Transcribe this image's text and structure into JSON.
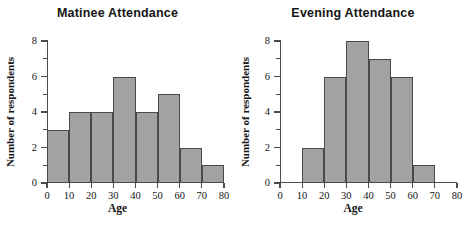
{
  "figure": {
    "panels": [
      "matinee",
      "evening"
    ]
  },
  "chart_data": [
    {
      "type": "bar",
      "title": "Matinee Attendance",
      "xlabel": "Age",
      "ylabel": "Number of respondents",
      "categories": [
        "0-10",
        "10-20",
        "20-30",
        "30-40",
        "40-50",
        "50-60",
        "60-70",
        "70-80"
      ],
      "bin_edges": [
        0,
        10,
        20,
        30,
        40,
        50,
        60,
        70,
        80
      ],
      "values": [
        3,
        4,
        4,
        6,
        4,
        5,
        2,
        1
      ],
      "xlim": [
        0,
        80
      ],
      "ylim": [
        0,
        8
      ],
      "xticks": [
        0,
        10,
        20,
        30,
        40,
        50,
        60,
        70,
        80
      ],
      "xticklabels": [
        "0",
        "10",
        "20",
        "30",
        "40",
        "50",
        "60",
        "70",
        "80"
      ],
      "yticks": [
        0,
        1,
        2,
        3,
        4,
        5,
        6,
        7,
        8
      ],
      "yticklabels": [
        "0",
        "",
        "2",
        "",
        "4",
        "",
        "6",
        "",
        "8"
      ],
      "grid": false,
      "legend": false,
      "bar_fill": "#a2a2a2",
      "bar_edge": "#4a4a4a"
    },
    {
      "type": "bar",
      "title": "Evening Attendance",
      "xlabel": "Age",
      "ylabel": "Number of respondents",
      "categories": [
        "0-10",
        "10-20",
        "20-30",
        "30-40",
        "40-50",
        "50-60",
        "60-70",
        "70-80"
      ],
      "bin_edges": [
        0,
        10,
        20,
        30,
        40,
        50,
        60,
        70,
        80
      ],
      "values": [
        0,
        2,
        6,
        8,
        7,
        6,
        1,
        0
      ],
      "xlim": [
        0,
        80
      ],
      "ylim": [
        0,
        8
      ],
      "xticks": [
        0,
        10,
        20,
        30,
        40,
        50,
        60,
        70,
        80
      ],
      "xticklabels": [
        "0",
        "10",
        "20",
        "30",
        "40",
        "50",
        "60",
        "70",
        "80"
      ],
      "yticks": [
        0,
        1,
        2,
        3,
        4,
        5,
        6,
        7,
        8
      ],
      "yticklabels": [
        "0",
        "",
        "2",
        "",
        "4",
        "",
        "6",
        "",
        "8"
      ],
      "grid": false,
      "legend": false,
      "bar_fill": "#a2a2a2",
      "bar_edge": "#4a4a4a"
    }
  ]
}
